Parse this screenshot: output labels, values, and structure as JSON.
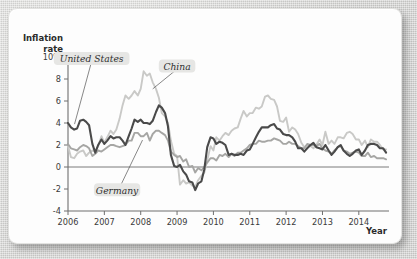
{
  "chart_data": {
    "type": "line",
    "title": "",
    "ylabel_line1": "Inflation",
    "ylabel_line2": "rate",
    "xlabel": "Year",
    "ylim": [
      -4,
      10
    ],
    "xlim": [
      2006.0,
      2014.83
    ],
    "yticks": [
      -4,
      -2,
      0,
      2,
      4,
      6,
      8,
      10
    ],
    "ytick_labels": [
      "-4",
      "-2",
      "0",
      "2",
      "4",
      "6",
      "8",
      "10%"
    ],
    "xticks": [
      2006,
      2007,
      2008,
      2009,
      2010,
      2011,
      2012,
      2013,
      2014
    ],
    "xtick_labels": [
      "2006",
      "2007",
      "2008",
      "2009",
      "2010",
      "2011",
      "2012",
      "2013",
      "2014"
    ],
    "grid": false,
    "legend_position": "inline-annotations",
    "zero_line": 0,
    "annotations": [
      {
        "name": "United States",
        "x": 2006.65,
        "y": 9.6,
        "leader_to_x": 2006.18,
        "leader_to_y": 3.9
      },
      {
        "name": "China",
        "x": 2009.0,
        "y": 8.9,
        "leader_to_x": 2008.33,
        "leader_to_y": 7.1
      },
      {
        "name": "Germany",
        "x": 2007.35,
        "y": -2.35,
        "leader_to_x": 2008.05,
        "leader_to_y": 2.45
      }
    ],
    "series": [
      {
        "name": "United States",
        "color": "#4a4a4a",
        "x": [
          2006.0,
          2006.08,
          2006.17,
          2006.25,
          2006.33,
          2006.42,
          2006.5,
          2006.58,
          2006.67,
          2006.75,
          2006.83,
          2006.92,
          2007.0,
          2007.08,
          2007.17,
          2007.25,
          2007.33,
          2007.42,
          2007.5,
          2007.58,
          2007.67,
          2007.75,
          2007.83,
          2007.92,
          2008.0,
          2008.08,
          2008.17,
          2008.25,
          2008.33,
          2008.42,
          2008.5,
          2008.58,
          2008.67,
          2008.75,
          2008.83,
          2008.92,
          2009.0,
          2009.08,
          2009.17,
          2009.25,
          2009.33,
          2009.42,
          2009.5,
          2009.58,
          2009.67,
          2009.75,
          2009.83,
          2009.92,
          2010.0,
          2010.08,
          2010.17,
          2010.25,
          2010.33,
          2010.42,
          2010.5,
          2010.58,
          2010.67,
          2010.75,
          2010.83,
          2010.92,
          2011.0,
          2011.08,
          2011.17,
          2011.25,
          2011.33,
          2011.42,
          2011.5,
          2011.58,
          2011.67,
          2011.75,
          2011.83,
          2011.92,
          2012.0,
          2012.08,
          2012.17,
          2012.25,
          2012.33,
          2012.42,
          2012.5,
          2012.58,
          2012.67,
          2012.75,
          2012.83,
          2012.92,
          2013.0,
          2013.08,
          2013.17,
          2013.25,
          2013.33,
          2013.42,
          2013.5,
          2013.58,
          2013.67,
          2013.75,
          2013.83,
          2013.92,
          2014.0,
          2014.08,
          2014.17,
          2014.25,
          2014.33,
          2014.42,
          2014.5,
          2014.58,
          2014.67,
          2014.75
        ],
        "y": [
          4.0,
          3.6,
          3.4,
          3.5,
          4.2,
          4.3,
          4.1,
          3.8,
          2.1,
          1.3,
          2.0,
          2.5,
          2.1,
          2.4,
          2.8,
          2.6,
          2.7,
          2.7,
          2.4,
          2.0,
          2.8,
          3.5,
          4.3,
          4.1,
          4.3,
          4.0,
          4.0,
          3.9,
          4.2,
          5.0,
          5.6,
          5.4,
          4.9,
          3.7,
          1.1,
          0.1,
          0.0,
          0.2,
          -0.4,
          -0.7,
          -1.3,
          -1.4,
          -2.1,
          -1.5,
          -1.3,
          -0.2,
          1.8,
          2.7,
          2.6,
          2.1,
          2.3,
          2.2,
          2.0,
          1.1,
          1.2,
          1.1,
          1.1,
          1.2,
          1.1,
          1.5,
          1.6,
          2.1,
          2.7,
          3.2,
          3.6,
          3.6,
          3.6,
          3.8,
          3.9,
          3.5,
          3.4,
          3.0,
          2.9,
          2.9,
          2.7,
          2.3,
          1.7,
          1.7,
          1.4,
          1.7,
          2.0,
          2.2,
          1.8,
          1.7,
          1.6,
          2.0,
          1.5,
          1.1,
          1.4,
          1.8,
          2.0,
          1.5,
          1.2,
          1.0,
          1.2,
          1.5,
          1.6,
          1.1,
          1.5,
          2.0,
          2.1,
          2.1,
          2.0,
          1.7,
          1.7,
          1.3
        ]
      },
      {
        "name": "China",
        "color": "#c9c9c7",
        "x": [
          2006.0,
          2006.08,
          2006.17,
          2006.25,
          2006.33,
          2006.42,
          2006.5,
          2006.58,
          2006.67,
          2006.75,
          2006.83,
          2006.92,
          2007.0,
          2007.08,
          2007.17,
          2007.25,
          2007.33,
          2007.42,
          2007.5,
          2007.58,
          2007.67,
          2007.75,
          2007.83,
          2007.92,
          2008.0,
          2008.08,
          2008.17,
          2008.25,
          2008.33,
          2008.42,
          2008.5,
          2008.58,
          2008.67,
          2008.75,
          2008.83,
          2008.92,
          2009.0,
          2009.08,
          2009.17,
          2009.25,
          2009.33,
          2009.42,
          2009.5,
          2009.58,
          2009.67,
          2009.75,
          2009.83,
          2009.92,
          2010.0,
          2010.08,
          2010.17,
          2010.25,
          2010.33,
          2010.42,
          2010.5,
          2010.58,
          2010.67,
          2010.75,
          2010.83,
          2010.92,
          2011.0,
          2011.08,
          2011.17,
          2011.25,
          2011.33,
          2011.42,
          2011.5,
          2011.58,
          2011.67,
          2011.75,
          2011.83,
          2011.92,
          2012.0,
          2012.08,
          2012.17,
          2012.25,
          2012.33,
          2012.42,
          2012.5,
          2012.58,
          2012.67,
          2012.75,
          2012.83,
          2012.92,
          2013.0,
          2013.08,
          2013.17,
          2013.25,
          2013.33,
          2013.42,
          2013.5,
          2013.58,
          2013.67,
          2013.75,
          2013.83,
          2013.92,
          2014.0,
          2014.08,
          2014.17,
          2014.25,
          2014.33,
          2014.42,
          2014.5,
          2014.58,
          2014.67,
          2014.75
        ],
        "y": [
          1.9,
          0.9,
          0.8,
          1.2,
          1.4,
          1.5,
          1.0,
          1.3,
          1.5,
          1.4,
          1.9,
          2.8,
          2.2,
          2.7,
          3.3,
          3.0,
          3.4,
          4.4,
          5.6,
          6.5,
          6.2,
          6.5,
          6.9,
          6.5,
          7.1,
          8.7,
          8.3,
          8.5,
          7.7,
          7.1,
          6.3,
          4.9,
          4.6,
          4.0,
          2.4,
          1.2,
          1.0,
          -1.6,
          -1.2,
          -1.5,
          -1.4,
          -1.7,
          -1.8,
          -1.2,
          -0.8,
          -0.5,
          0.6,
          1.9,
          1.5,
          2.7,
          2.4,
          2.8,
          3.1,
          2.9,
          3.3,
          3.5,
          3.6,
          4.4,
          5.1,
          4.6,
          4.9,
          4.9,
          5.4,
          5.3,
          5.5,
          6.4,
          6.5,
          6.2,
          6.1,
          5.5,
          4.2,
          4.1,
          4.5,
          3.2,
          3.6,
          3.4,
          3.0,
          2.2,
          1.8,
          2.0,
          1.9,
          1.7,
          2.0,
          2.5,
          2.0,
          3.2,
          2.1,
          2.4,
          2.1,
          2.7,
          2.7,
          2.6,
          3.1,
          3.2,
          3.0,
          2.5,
          2.5,
          2.0,
          2.4,
          1.8,
          2.5,
          2.3,
          2.3,
          2.0,
          1.6,
          1.6
        ]
      },
      {
        "name": "Germany",
        "color": "#a6a6a4",
        "x": [
          2006.0,
          2006.08,
          2006.17,
          2006.25,
          2006.33,
          2006.42,
          2006.5,
          2006.58,
          2006.67,
          2006.75,
          2006.83,
          2006.92,
          2007.0,
          2007.08,
          2007.17,
          2007.25,
          2007.33,
          2007.42,
          2007.5,
          2007.58,
          2007.67,
          2007.75,
          2007.83,
          2007.92,
          2008.0,
          2008.08,
          2008.17,
          2008.25,
          2008.33,
          2008.42,
          2008.5,
          2008.58,
          2008.67,
          2008.75,
          2008.83,
          2008.92,
          2009.0,
          2009.08,
          2009.17,
          2009.25,
          2009.33,
          2009.42,
          2009.5,
          2009.58,
          2009.67,
          2009.75,
          2009.83,
          2009.92,
          2010.0,
          2010.08,
          2010.17,
          2010.25,
          2010.33,
          2010.42,
          2010.5,
          2010.58,
          2010.67,
          2010.75,
          2010.83,
          2010.92,
          2011.0,
          2011.08,
          2011.17,
          2011.25,
          2011.33,
          2011.42,
          2011.5,
          2011.58,
          2011.67,
          2011.75,
          2011.83,
          2011.92,
          2012.0,
          2012.08,
          2012.17,
          2012.25,
          2012.33,
          2012.42,
          2012.5,
          2012.58,
          2012.67,
          2012.75,
          2012.83,
          2012.92,
          2013.0,
          2013.08,
          2013.17,
          2013.25,
          2013.33,
          2013.42,
          2013.5,
          2013.58,
          2013.67,
          2013.75,
          2013.83,
          2013.92,
          2014.0,
          2014.08,
          2014.17,
          2014.25,
          2014.33,
          2014.42,
          2014.5,
          2014.58,
          2014.67,
          2014.75
        ],
        "y": [
          2.1,
          1.7,
          1.6,
          1.5,
          1.8,
          2.0,
          1.9,
          1.7,
          1.0,
          1.2,
          1.5,
          1.4,
          1.6,
          1.8,
          2.0,
          2.0,
          1.9,
          1.8,
          1.9,
          2.0,
          2.4,
          2.4,
          3.1,
          3.1,
          2.8,
          2.8,
          3.1,
          2.4,
          3.0,
          3.3,
          3.3,
          3.1,
          2.9,
          2.4,
          1.4,
          1.1,
          0.9,
          1.0,
          0.5,
          0.7,
          0.0,
          0.1,
          -0.5,
          -0.1,
          -0.3,
          0.0,
          0.4,
          0.8,
          0.8,
          0.6,
          1.1,
          1.0,
          1.2,
          0.9,
          1.2,
          1.0,
          1.3,
          1.3,
          1.5,
          1.7,
          2.0,
          2.1,
          2.1,
          2.4,
          2.3,
          2.3,
          2.4,
          2.4,
          2.6,
          2.5,
          2.4,
          2.1,
          2.1,
          2.3,
          2.1,
          2.1,
          1.9,
          1.7,
          1.7,
          2.1,
          2.0,
          2.0,
          1.9,
          2.1,
          1.7,
          1.5,
          1.4,
          1.2,
          1.5,
          1.8,
          1.9,
          1.5,
          1.4,
          1.2,
          1.3,
          1.4,
          1.3,
          1.0,
          1.0,
          1.3,
          0.9,
          1.0,
          0.8,
          0.8,
          0.8,
          0.7
        ]
      }
    ]
  }
}
